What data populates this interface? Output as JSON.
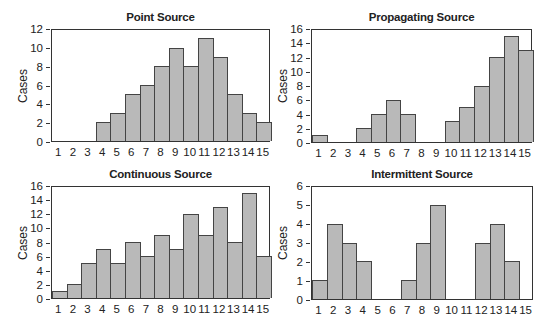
{
  "chart_data": [
    {
      "type": "bar",
      "title": "Point Source",
      "xlabel": "",
      "ylabel": "Cases",
      "categories": [
        "1",
        "2",
        "3",
        "4",
        "5",
        "6",
        "7",
        "8",
        "9",
        "10",
        "11",
        "12",
        "13",
        "14",
        "15"
      ],
      "values": [
        0,
        0,
        0,
        2,
        3,
        5,
        6,
        8,
        10,
        8,
        11,
        9,
        5,
        3,
        2
      ],
      "ylim": [
        0,
        12
      ],
      "yticks": [
        0,
        2,
        4,
        6,
        8,
        10,
        12
      ],
      "grid": false
    },
    {
      "type": "bar",
      "title": "Propagating Source",
      "xlabel": "",
      "ylabel": "Cases",
      "categories": [
        "1",
        "2",
        "3",
        "4",
        "5",
        "6",
        "7",
        "8",
        "9",
        "10",
        "11",
        "12",
        "13",
        "14",
        "15"
      ],
      "values": [
        1,
        0,
        0,
        2,
        4,
        6,
        4,
        0,
        0,
        3,
        5,
        8,
        12,
        15,
        13
      ],
      "ylim": [
        0,
        16
      ],
      "yticks": [
        0,
        2,
        4,
        6,
        8,
        10,
        12,
        14,
        16
      ],
      "grid": false
    },
    {
      "type": "bar",
      "title": "Continuous Source",
      "xlabel": "",
      "ylabel": "Cases",
      "categories": [
        "1",
        "2",
        "3",
        "4",
        "5",
        "6",
        "7",
        "8",
        "9",
        "10",
        "11",
        "12",
        "13",
        "14",
        "15"
      ],
      "values": [
        1,
        2,
        5,
        7,
        5,
        8,
        6,
        9,
        7,
        12,
        9,
        13,
        8,
        15,
        6
      ],
      "ylim": [
        0,
        16
      ],
      "yticks": [
        0,
        2,
        4,
        6,
        8,
        10,
        12,
        14,
        16
      ],
      "grid": false
    },
    {
      "type": "bar",
      "title": "Intermittent Source",
      "xlabel": "",
      "ylabel": "Cases",
      "categories": [
        "1",
        "2",
        "3",
        "4",
        "5",
        "6",
        "7",
        "8",
        "9",
        "10",
        "11",
        "12",
        "13",
        "14",
        "15"
      ],
      "values": [
        1,
        4,
        3,
        2,
        0,
        0,
        1,
        3,
        5,
        0,
        0,
        3,
        4,
        2,
        0
      ],
      "ylim": [
        0,
        6
      ],
      "yticks": [
        0,
        1,
        2,
        3,
        4,
        5,
        6
      ],
      "grid": false
    }
  ],
  "layout": [
    {
      "left": 51,
      "top": 29,
      "right": 270,
      "bottom": 142,
      "titleY": 11
    },
    {
      "left": 311,
      "top": 29,
      "right": 532,
      "bottom": 143,
      "titleY": 11
    },
    {
      "left": 51,
      "top": 186,
      "right": 270,
      "bottom": 299,
      "titleY": 168
    },
    {
      "left": 311,
      "top": 186,
      "right": 533,
      "bottom": 300,
      "titleY": 168
    }
  ],
  "colors": {
    "bar_fill": "#b9b9b9",
    "bar_edge": "#444444",
    "axis": "#333333"
  }
}
